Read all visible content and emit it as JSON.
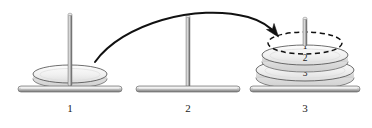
{
  "figure": {
    "background_color": "#ffffff",
    "ink_color": "#1a1a1a",
    "metal_light": "#f2f2f2",
    "metal_mid": "#b8b8b8",
    "metal_dark": "#6e6e6e",
    "disk_fill": "#f4f4f4",
    "disk_edge": "#4a4a4a"
  },
  "pegs": [
    {
      "id": "peg-1",
      "label": "1",
      "center_x": 70,
      "base_y": 89,
      "base_width": 104,
      "rod_height": 74,
      "disks": [
        {
          "id": "peg1-disk",
          "label": "",
          "size": "small",
          "style": "solid",
          "cx": 70,
          "cy": 76,
          "rx": 37,
          "ry": 9
        }
      ]
    },
    {
      "id": "peg-2",
      "label": "2",
      "center_x": 188,
      "base_y": 89,
      "base_width": 104,
      "rod_height": 72,
      "disks": []
    },
    {
      "id": "peg-3",
      "label": "3",
      "center_x": 305,
      "base_y": 89,
      "base_width": 110,
      "rod_height": 36,
      "disks": [
        {
          "id": "peg3-ghost-disk",
          "label": "1",
          "size": "small",
          "style": "dashed",
          "cx": 305,
          "cy": 43,
          "rx": 37,
          "ry": 11
        },
        {
          "id": "peg3-disk-2",
          "label": "2",
          "size": "medium",
          "style": "solid",
          "cx": 305,
          "cy": 56,
          "rx": 43,
          "ry": 10
        },
        {
          "id": "peg3-disk-3",
          "label": "3",
          "size": "large",
          "style": "solid",
          "cx": 305,
          "cy": 71,
          "rx": 49,
          "ry": 11
        }
      ]
    }
  ],
  "arrow": {
    "id": "move-arrow",
    "description": "curved arrow from peg 1 over peg 2 to peg 3",
    "start_x": 95,
    "start_y": 62,
    "end_x": 277,
    "end_y": 35,
    "color": "#111111"
  },
  "labels": {
    "peg_1": "1",
    "peg_2": "2",
    "peg_3": "3",
    "ghost_disk": "1",
    "disk_2": "2",
    "disk_3": "3"
  }
}
